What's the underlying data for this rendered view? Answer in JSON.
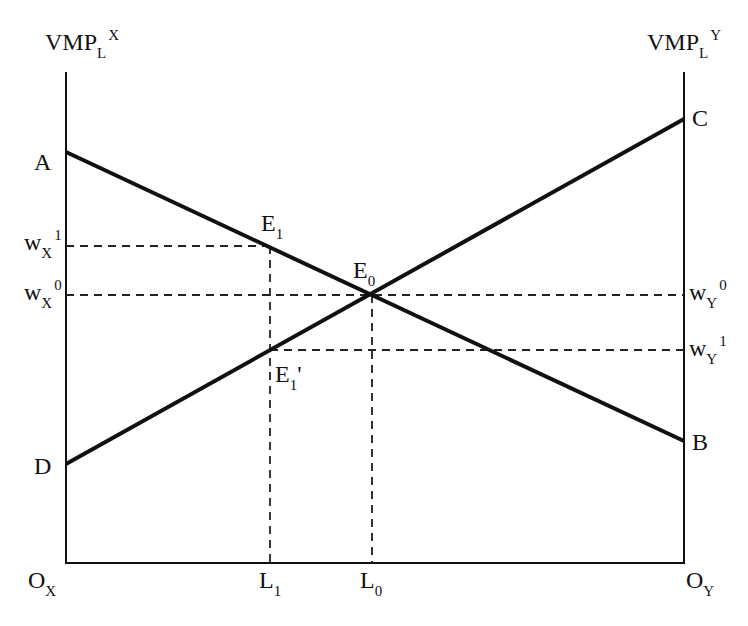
{
  "diagram": {
    "type": "specific-factors labor allocation diagram",
    "left_axis": {
      "label_main": "VMP",
      "label_sub": "L",
      "label_sup": "X",
      "origin_main": "O",
      "origin_sub": "X"
    },
    "right_axis": {
      "label_main": "VMP",
      "label_sub": "L",
      "label_sup": "Y",
      "origin_main": "O",
      "origin_sub": "Y"
    },
    "points": {
      "A": "A",
      "B": "B",
      "C": "C",
      "D": "D"
    },
    "equilibria": {
      "E1": {
        "main": "E",
        "sub": "1"
      },
      "E0": {
        "main": "E",
        "sub": "0"
      },
      "E1prime": {
        "main": "E",
        "sub": "1",
        "prime": "'"
      }
    },
    "wages": {
      "wX1": {
        "main": "w",
        "sub": "X",
        "sup": "1"
      },
      "wX0": {
        "main": "w",
        "sub": "X",
        "sup": "0"
      },
      "wY0": {
        "main": "w",
        "sub": "Y",
        "sup": "0"
      },
      "wY1": {
        "main": "w",
        "sub": "Y",
        "sup": "1"
      }
    },
    "labor": {
      "L1": {
        "main": "L",
        "sub": "1"
      },
      "L0": {
        "main": "L",
        "sub": "0"
      }
    },
    "lines": [
      {
        "name": "VMPLX",
        "from": "A",
        "to": "B",
        "style": "solid-thick"
      },
      {
        "name": "VMPLY",
        "from": "D",
        "to": "C",
        "style": "solid-thick"
      },
      {
        "name": "wX1-level",
        "style": "dashed"
      },
      {
        "name": "wX0-wY0-level",
        "style": "dashed"
      },
      {
        "name": "wY1-level",
        "style": "dashed"
      },
      {
        "name": "L1-vertical",
        "style": "dashed"
      },
      {
        "name": "L0-vertical",
        "style": "dashed"
      }
    ],
    "colors": {
      "ink": "#111111",
      "background": "#ffffff"
    }
  }
}
